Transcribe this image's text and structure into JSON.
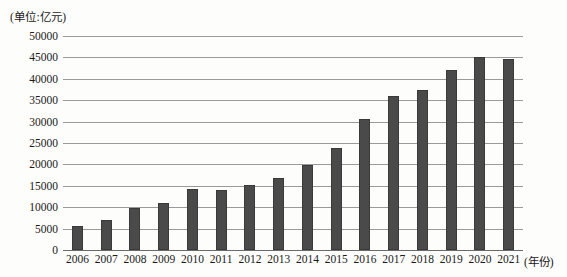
{
  "chart_data": {
    "type": "bar",
    "title": "",
    "subtitle": "",
    "unit_caption": "(单位:亿元)",
    "xlabel": "(年份)",
    "ylabel": "",
    "categories": [
      "2006",
      "2007",
      "2008",
      "2009",
      "2010",
      "2011",
      "2012",
      "2013",
      "2014",
      "2015",
      "2016",
      "2017",
      "2018",
      "2019",
      "2020",
      "2021"
    ],
    "values": [
      5700,
      7000,
      9700,
      10900,
      14300,
      14100,
      15200,
      16900,
      19900,
      23900,
      30500,
      36100,
      37500,
      42000,
      45000,
      44600
    ],
    "ylim": [
      0,
      50000
    ],
    "ytick_labels": [
      "50000",
      "45000",
      "40000",
      "35000",
      "30000",
      "25000",
      "20000",
      "15000",
      "10000",
      "5000",
      "0"
    ],
    "ytick_values": [
      50000,
      45000,
      40000,
      35000,
      30000,
      25000,
      20000,
      15000,
      10000,
      5000,
      0
    ],
    "grid": "horizontal",
    "legend": "none",
    "bar_color": "#4a4a4a",
    "grid_color": "#9a9a9a",
    "axis_color": "#6a6a6a",
    "background_color": "#fdfdfb"
  }
}
